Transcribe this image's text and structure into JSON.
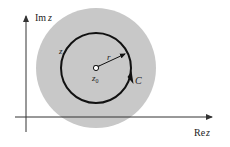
{
  "diagram": {
    "axes": {
      "y_label_prefix": "Im",
      "y_label_var": "z",
      "x_label_prefix": "Re",
      "x_label_var": "z"
    },
    "labels": {
      "point_on_contour": "z",
      "radius": "r",
      "center": "z",
      "center_subscript": "0",
      "contour": "C"
    },
    "colors": {
      "disc": "#c8c8c8",
      "contour": "#111111",
      "axes": "#333333",
      "background": "#ffffff"
    }
  }
}
